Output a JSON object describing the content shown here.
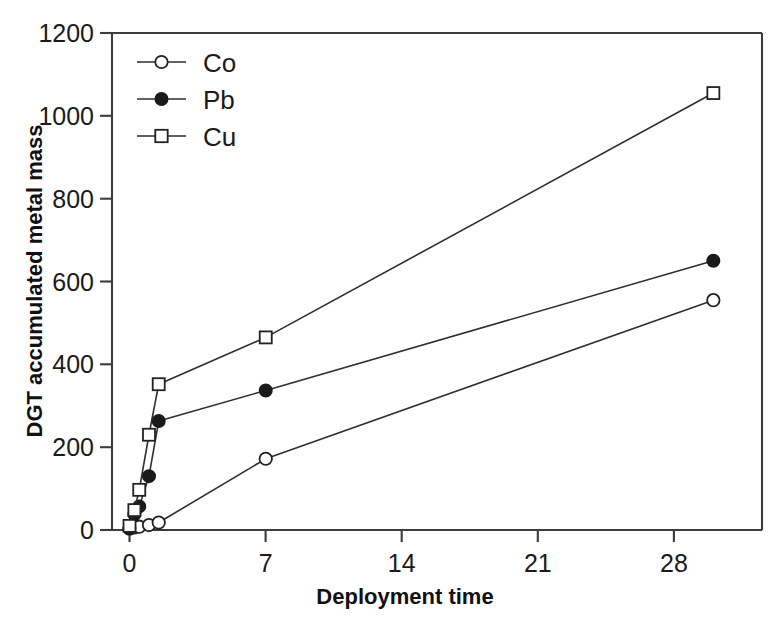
{
  "chart_data": {
    "type": "line",
    "title": "",
    "subtitle": "",
    "xlabel": "Deployment time",
    "ylabel": "DGT accumulated metal mass",
    "xlim": [
      -0.9,
      32.5
    ],
    "ylim": [
      0,
      1200
    ],
    "xticks": [
      0,
      7,
      14,
      21,
      28
    ],
    "yticks": [
      0,
      200,
      400,
      600,
      800,
      1000,
      1200
    ],
    "xtick_labels": [
      "0",
      "7",
      "14",
      "21",
      "28"
    ],
    "ytick_labels": [
      "0",
      "200",
      "400",
      "600",
      "800",
      "1000",
      "1200"
    ],
    "grid": false,
    "legend_position": "top-left",
    "legend_entries": [
      "Co",
      "Pb",
      "Cu"
    ],
    "series": [
      {
        "name": "Co",
        "marker": "open-circle",
        "x": [
          0,
          0.25,
          0.5,
          1.0,
          1.5,
          7,
          30
        ],
        "values": [
          3,
          6,
          8,
          12,
          18,
          172,
          555
        ]
      },
      {
        "name": "Pb",
        "marker": "filled-circle",
        "x": [
          0,
          0.25,
          0.5,
          1.0,
          1.5,
          7,
          30
        ],
        "values": [
          5,
          38,
          57,
          130,
          263,
          337,
          650
        ]
      },
      {
        "name": "Cu",
        "marker": "open-square",
        "x": [
          0,
          0.25,
          0.5,
          1.0,
          1.5,
          7,
          30
        ],
        "values": [
          10,
          48,
          97,
          230,
          352,
          465,
          1055
        ]
      }
    ]
  },
  "axes": {
    "x_title": "Deployment time",
    "y_title": "DGT accumulated metal mass"
  },
  "colors": {
    "line": "#2e2e2e",
    "axis": "#3c3c3c",
    "text": "#1a1a1a",
    "background": "#ffffff",
    "marker_fill_open": "#ffffff",
    "marker_fill_solid": "#1a1a1a"
  }
}
